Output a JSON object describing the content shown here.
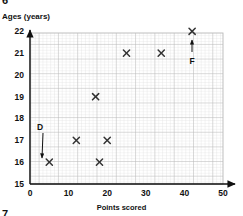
{
  "exercise": {
    "number_top": "6",
    "number_bottom": "7"
  },
  "chart_data": {
    "type": "scatter",
    "title": "",
    "xlabel": "Points scored",
    "ylabel": "Ages (years)",
    "xlim": [
      0,
      50
    ],
    "ylim": [
      15,
      22
    ],
    "xticks": [
      0,
      10,
      20,
      30,
      40,
      50
    ],
    "yticks": [
      15,
      16,
      17,
      18,
      19,
      20,
      21,
      22
    ],
    "xtick_labels": [
      "0",
      "10",
      "20",
      "30",
      "40",
      "50"
    ],
    "ytick_labels": [
      "15",
      "16",
      "17",
      "18",
      "19",
      "20",
      "21",
      "22"
    ],
    "grid": true,
    "grid_minor": true,
    "legend": "none",
    "marker": "x",
    "points": [
      {
        "x": 5,
        "y": 16
      },
      {
        "x": 12,
        "y": 17
      },
      {
        "x": 17,
        "y": 19
      },
      {
        "x": 18,
        "y": 16
      },
      {
        "x": 20,
        "y": 17
      },
      {
        "x": 25,
        "y": 21
      },
      {
        "x": 34,
        "y": 21
      },
      {
        "x": 42,
        "y": 22
      }
    ],
    "annotations": [
      {
        "label": "D",
        "points_to_x": 5,
        "points_to_y": 16,
        "direction": "down"
      },
      {
        "label": "F",
        "points_to_x": 42,
        "points_to_y": 22,
        "direction": "up"
      }
    ]
  },
  "colors": {
    "axis": "#111111",
    "marker": "#333333",
    "grid_minor": "#d9d9d9",
    "grid_major": "#b3b3b3",
    "text": "#111111",
    "background": "#ffffff"
  }
}
